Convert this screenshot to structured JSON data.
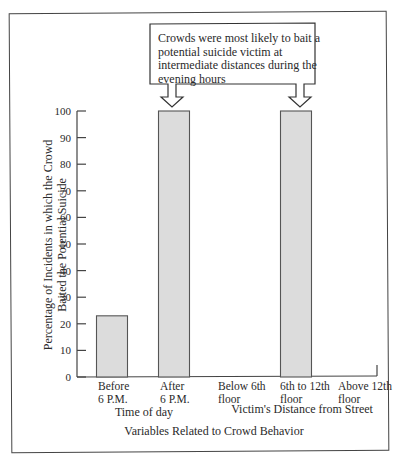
{
  "chart_data": {
    "type": "bar",
    "title": "",
    "ylabel_lines": [
      "Percentage of Incidents in which the Crowd",
      "Baited the Potential Suicide"
    ],
    "xlabel": "Variables Related to Crowd Behavior",
    "ylim": [
      0,
      100
    ],
    "yticks": [
      0,
      10,
      20,
      30,
      40,
      50,
      60,
      70,
      80,
      90,
      100
    ],
    "grid": false,
    "groups": [
      {
        "label": "Time of day",
        "categories": [
          {
            "label_lines": [
              "Before",
              "6 P.M."
            ],
            "value": 23
          },
          {
            "label_lines": [
              "After",
              "6 P.M."
            ],
            "value": 100
          }
        ]
      },
      {
        "label": "Victim's Distance from Street",
        "categories": [
          {
            "label_lines": [
              "Below 6th",
              "floor"
            ],
            "value": 0
          },
          {
            "label_lines": [
              "6th to 12th",
              "floor"
            ],
            "value": 100
          },
          {
            "label_lines": [
              "Above 12th",
              "floor"
            ],
            "value": 0
          }
        ]
      }
    ],
    "annotation": {
      "lines": [
        "Crowds were most likely to bait a",
        "potential suicide victim at",
        "intermediate distances during the",
        "evening hours"
      ],
      "points_to": [
        "After 6 P.M.",
        "6th to 12th floor"
      ]
    },
    "colors": {
      "bar_fill": "#dcdcdc",
      "bar_stroke": "#555555"
    }
  }
}
